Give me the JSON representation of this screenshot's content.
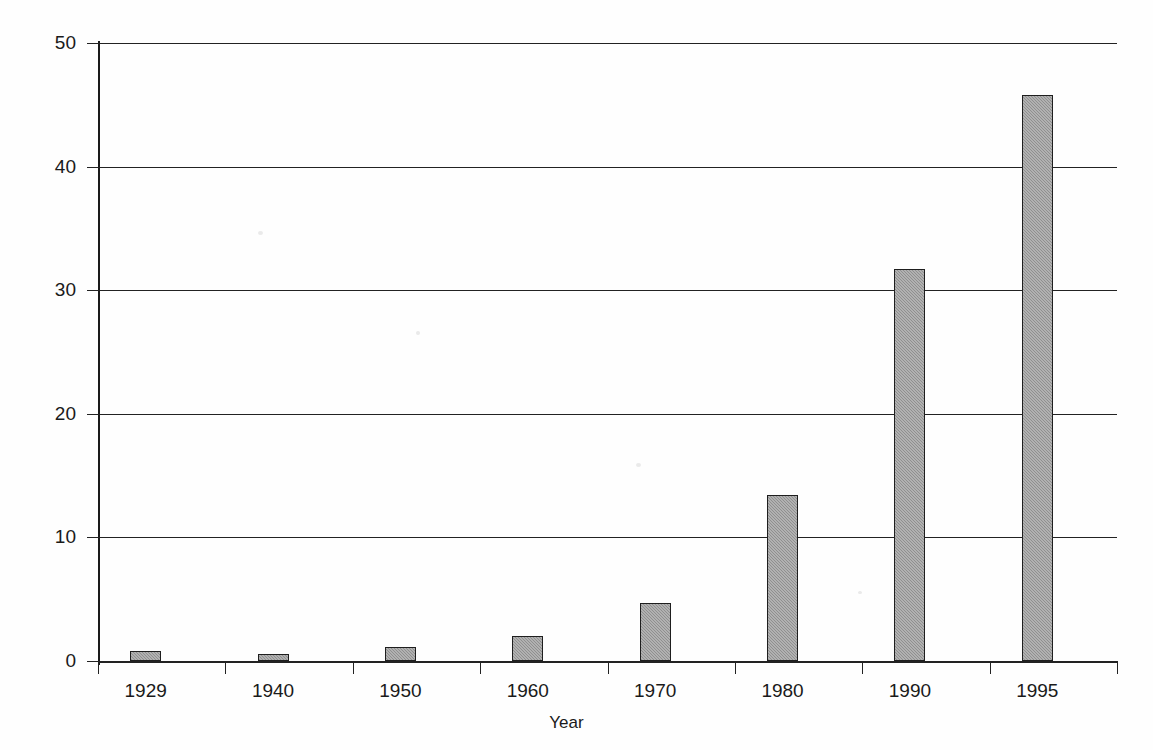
{
  "chart_data": {
    "type": "bar",
    "title": "",
    "xlabel": "Year",
    "ylabel": "$ Billions",
    "categories": [
      "1929",
      "1940",
      "1950",
      "1960",
      "1970",
      "1980",
      "1990",
      "1995"
    ],
    "values": [
      0.8,
      0.6,
      1.1,
      2.0,
      4.7,
      13.4,
      31.7,
      45.8
    ],
    "ylim": [
      0,
      50
    ],
    "yticks": [
      0,
      10,
      20,
      30,
      40,
      50
    ],
    "ytick_labels": [
      "0",
      "10",
      "20",
      "30",
      "40",
      "50"
    ],
    "grid": true,
    "grid_axis": "y",
    "legend": false,
    "bar_color": "#8f8f8f",
    "bar_edge_color": "#1e1e1e",
    "axis_color": "#1a1a1a",
    "background": "#ffffff"
  },
  "axes": {
    "y_label_text": "$ Billions",
    "x_label_text": "Year"
  }
}
